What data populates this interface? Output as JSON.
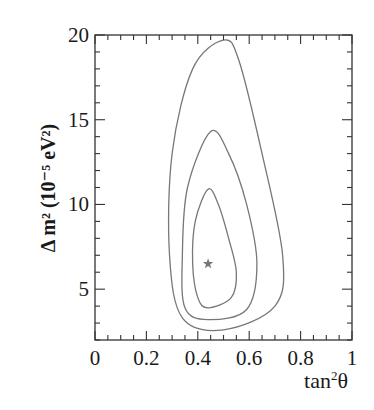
{
  "chart_data": {
    "type": "contour",
    "title": "",
    "xlabel": "tan²θ",
    "ylabel": "Δ m² (10⁻⁵ eV²)",
    "xlim": [
      0,
      1
    ],
    "ylim": [
      2,
      20
    ],
    "x_ticks": [
      "0",
      "0.2",
      "0.4",
      "0.6",
      "0.8",
      "1"
    ],
    "y_ticks": [
      "5",
      "10",
      "15",
      "20"
    ],
    "grid": false,
    "legend": null,
    "best_fit": {
      "marker": "star",
      "x": 0.44,
      "y": 6.5
    },
    "contours": [
      {
        "name": "inner",
        "points": [
          [
            0.44,
            10.9
          ],
          [
            0.48,
            10.0
          ],
          [
            0.52,
            8.0
          ],
          [
            0.55,
            6.0
          ],
          [
            0.53,
            4.5
          ],
          [
            0.44,
            3.9
          ],
          [
            0.4,
            4.5
          ],
          [
            0.38,
            6.5
          ],
          [
            0.39,
            9.0
          ]
        ]
      },
      {
        "name": "middle",
        "points": [
          [
            0.45,
            14.3
          ],
          [
            0.52,
            13.0
          ],
          [
            0.59,
            10.0
          ],
          [
            0.63,
            6.5
          ],
          [
            0.59,
            3.8
          ],
          [
            0.44,
            3.2
          ],
          [
            0.35,
            3.9
          ],
          [
            0.34,
            7.0
          ],
          [
            0.36,
            11.0
          ]
        ]
      },
      {
        "name": "outer",
        "points": [
          [
            0.5,
            19.7
          ],
          [
            0.56,
            18.5
          ],
          [
            0.65,
            13.0
          ],
          [
            0.73,
            7.0
          ],
          [
            0.7,
            4.0
          ],
          [
            0.5,
            2.6
          ],
          [
            0.34,
            3.3
          ],
          [
            0.29,
            7.0
          ],
          [
            0.3,
            13.0
          ],
          [
            0.38,
            18.0
          ]
        ]
      }
    ]
  },
  "axes": {
    "xlabel_main": "tan",
    "xlabel_sup": "2",
    "xlabel_theta": "θ",
    "ylabel_text": "Δ m² (10⁻⁵ eV²)"
  },
  "colors": {
    "frame": "#333333",
    "contour": "#777777",
    "star": "#777777"
  }
}
